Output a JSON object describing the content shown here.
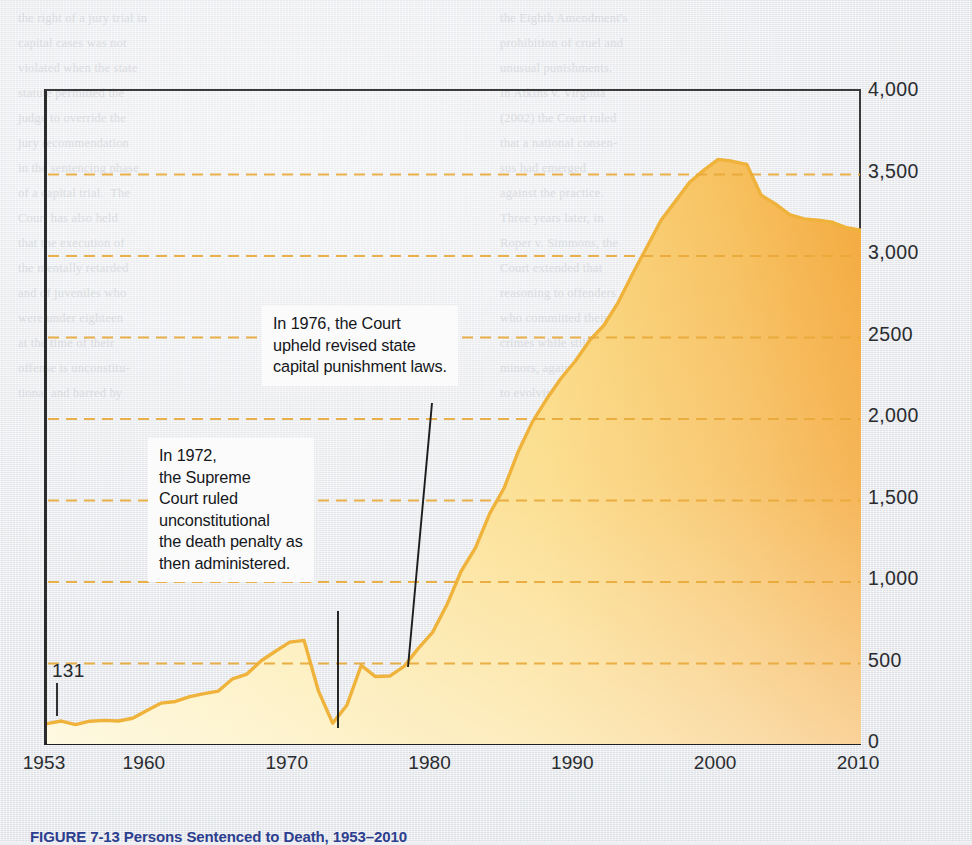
{
  "figure": {
    "caption": "FIGURE 7-13   Persons Sentenced to Death, 1953–2010",
    "value_label_131": "131"
  },
  "callouts": [
    {
      "id": "callout-1976",
      "text": "In 1976, the Court\nupheld revised state\ncapital punishment laws."
    },
    {
      "id": "callout-1972",
      "text": "In 1972,\nthe Supreme\nCourt ruled\nunconstitutional\nthe death penalty as\nthen administered."
    }
  ],
  "colors": {
    "area_light": "#fdf3c6",
    "area_mid": "#fbd97f",
    "area_dark": "#f4a93c",
    "line": "#efb33c",
    "gridline": "#e8a93a",
    "axis": "#222222",
    "paper": "#eceef1",
    "caption": "#2c3e8f"
  },
  "ghost_text": {
    "left_block": "the right of a jury trial in\ncapital cases was not\nviolated when the state\nstatute permitted the\njudge to override the\njury recommendation\nin the sentencing phase\nof a capital trial.  The\nCourt has also held\nthat the execution of\nthe mentally retarded\nand of juveniles who\nwere under eighteen\nat the time of their\noffense is unconstitu-\ntional and barred by",
    "right_block": "the Eighth Amendment's\nprohibition of cruel and\nunusual punishments.\nIn Atkins v. Virginia\n(2002) the Court ruled\nthat a national consen-\nsus had emerged\nagainst the practice.\nThree years later, in\nRoper v. Simmons, the\nCourt extended that\nreasoning to offenders\nwho committed their\ncrimes while still\nminors, again pointing\nto evolving standards"
  },
  "chart_data": {
    "type": "area",
    "title": "Persons Sentenced to Death, 1953–2010",
    "xlabel": "Year",
    "ylabel": "Number under\nsentence of death",
    "xlim": [
      1953,
      2010
    ],
    "ylim": [
      0,
      4000
    ],
    "grid": true,
    "gridlines": [
      500,
      1000,
      1500,
      2000,
      2500,
      3000,
      3500
    ],
    "xticks": [
      "1953",
      "1960",
      "1970",
      "1980",
      "1990",
      "2000",
      "2010"
    ],
    "xtick_values": [
      1953,
      1960,
      1970,
      1980,
      1990,
      2000,
      2010
    ],
    "yticks": [
      "0",
      "500",
      "1,000",
      "1,500",
      "2,000",
      "2500",
      "3,000",
      "3,500",
      "4,000"
    ],
    "ytick_values": [
      0,
      500,
      1000,
      1500,
      2000,
      2500,
      3000,
      3500,
      4000
    ],
    "series_name": "Number under sentence of death",
    "x": [
      1953,
      1954,
      1955,
      1956,
      1957,
      1958,
      1959,
      1960,
      1961,
      1962,
      1963,
      1964,
      1965,
      1966,
      1967,
      1968,
      1969,
      1970,
      1971,
      1972,
      1973,
      1974,
      1975,
      1976,
      1977,
      1978,
      1979,
      1980,
      1981,
      1982,
      1983,
      1984,
      1985,
      1986,
      1987,
      1988,
      1989,
      1990,
      1991,
      1992,
      1993,
      1994,
      1995,
      1996,
      1997,
      1998,
      1999,
      2000,
      2001,
      2002,
      2003,
      2004,
      2005,
      2006,
      2007,
      2008,
      2009,
      2010
    ],
    "values": [
      131,
      147,
      125,
      146,
      151,
      147,
      164,
      212,
      257,
      267,
      297,
      315,
      331,
      406,
      435,
      517,
      575,
      631,
      642,
      334,
      134,
      244,
      488,
      420,
      423,
      482,
      593,
      691,
      860,
      1066,
      1209,
      1420,
      1575,
      1800,
      1984,
      2124,
      2250,
      2356,
      2482,
      2575,
      2716,
      2890,
      3054,
      3219,
      3335,
      3452,
      3527,
      3593,
      3581,
      3562,
      3374,
      3320,
      3254,
      3228,
      3220,
      3207,
      3173,
      3158
    ],
    "annotations": [
      {
        "x": 1972,
        "text": "In 1972, the Supreme Court ruled unconstitutional the death penalty as then administered."
      },
      {
        "x": 1976,
        "text": "In 1976, the Court upheld revised state capital punishment laws."
      },
      {
        "x": 1953,
        "y": 131,
        "text": "131"
      }
    ]
  }
}
